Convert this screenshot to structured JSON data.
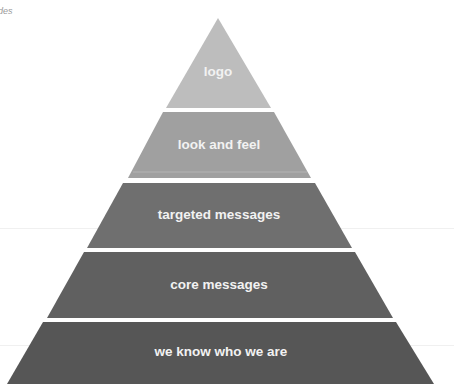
{
  "corner_text": "des",
  "diagram": {
    "type": "pyramid",
    "tiers": [
      {
        "label": "logo",
        "color": "#bdbdbd",
        "top": 18,
        "bottom": 108
      },
      {
        "label": "look and feel",
        "color": "#a0a0a0",
        "top": 112,
        "bottom": 178
      },
      {
        "label": "targeted messages",
        "color": "#6f6f6f",
        "top": 183,
        "bottom": 248
      },
      {
        "label": "core messages",
        "color": "#606060",
        "top": 252,
        "bottom": 318
      },
      {
        "label": "we know who we are",
        "color": "#565656",
        "top": 322,
        "bottom": 384
      }
    ],
    "label_color": "#f2f2f2"
  }
}
